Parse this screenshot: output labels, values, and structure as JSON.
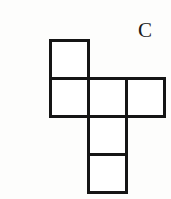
{
  "figure": {
    "label": "C",
    "label_name": "option-label-c",
    "kind": "cube-net-diagram",
    "background_color": "#fdfdfc",
    "stroke_color": "#151515",
    "fill_color": "#ffffff",
    "stroke_width": 3,
    "cell_size": 38,
    "grid_origin": {
      "x": 50,
      "y": 40
    },
    "squares": [
      {
        "name": "square-top",
        "col": 0,
        "row": 0,
        "x": 50,
        "y": 40,
        "w": 38,
        "h": 38
      },
      {
        "name": "square-middle-left",
        "col": 0,
        "row": 1,
        "x": 50,
        "y": 78,
        "w": 38,
        "h": 38
      },
      {
        "name": "square-middle-center",
        "col": 1,
        "row": 1,
        "x": 88,
        "y": 78,
        "w": 38,
        "h": 38
      },
      {
        "name": "square-middle-right",
        "col": 2,
        "row": 1,
        "x": 126,
        "y": 78,
        "w": 38,
        "h": 38
      },
      {
        "name": "square-lower",
        "col": 1,
        "row": 2,
        "x": 88,
        "y": 116,
        "w": 38,
        "h": 38
      },
      {
        "name": "square-bottom",
        "col": 1,
        "row": 3,
        "x": 88,
        "y": 154,
        "w": 38,
        "h": 38
      }
    ]
  }
}
